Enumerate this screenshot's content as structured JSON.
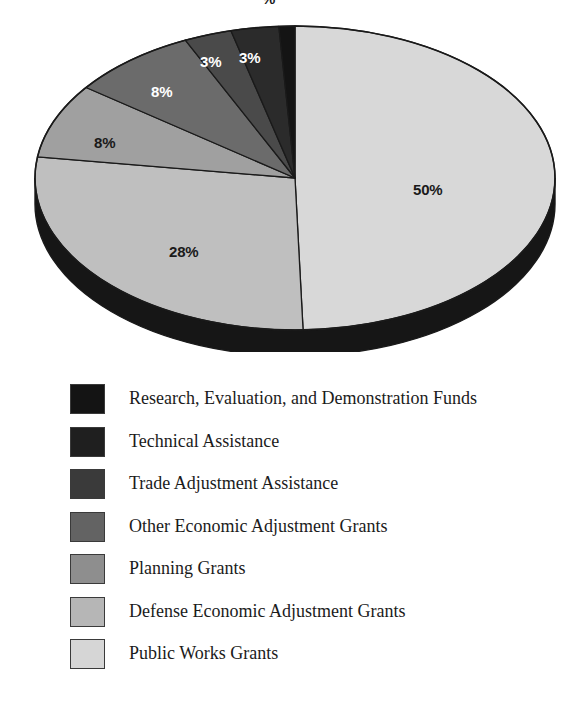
{
  "chart_data": {
    "type": "pie",
    "title": "",
    "subtitle": "",
    "xlabel": "",
    "ylabel": "",
    "legend_position": "below",
    "grid": false,
    "units": "percent",
    "value_suffix": "%",
    "three_d": true,
    "categories": [
      "Public Works Grants",
      "Defense Economic Adjustment Grants",
      "Planning Grants",
      "Other Economic Adjustment Grants",
      "Trade Adjustment Assistance",
      "Technical Assistance",
      "Research, Evaluation, and Demonstration Funds"
    ],
    "values": [
      50,
      28,
      8,
      8,
      3,
      3,
      1
    ],
    "slices": [
      {
        "label": "Public Works Grants",
        "value": 50,
        "display": "50%",
        "color": "#d8d8d8",
        "label_color": "#1a1a1a"
      },
      {
        "label": "Defense Economic Adjustment Grants",
        "value": 28,
        "display": "28%",
        "color": "#bfbfbf",
        "label_color": "#1a1a1a"
      },
      {
        "label": "Planning Grants",
        "value": 8,
        "display": "8%",
        "color": "#a0a0a0",
        "label_color": "#1a1a1a"
      },
      {
        "label": "Other Economic Adjustment Grants",
        "value": 8,
        "display": "8%",
        "color": "#6b6b6b",
        "label_color": "#ffffff"
      },
      {
        "label": "Trade Adjustment Assistance",
        "value": 3,
        "display": "3%",
        "color": "#4a4a4a",
        "label_color": "#ffffff"
      },
      {
        "label": "Technical Assistance",
        "value": 3,
        "display": "3%",
        "color": "#2b2b2b",
        "label_color": "#ffffff"
      },
      {
        "label": "Research, Evaluation, and Demonstration Funds",
        "value": 1,
        "display": "%",
        "color": "#141414",
        "label_color": "#1a1a1a"
      }
    ],
    "data_labels": [
      {
        "name": "slice-label-50",
        "text": "50%",
        "x": 413,
        "y": 182,
        "tone": "dark"
      },
      {
        "name": "slice-label-28",
        "text": "28%",
        "x": 169,
        "y": 244,
        "tone": "dark"
      },
      {
        "name": "slice-label-8a",
        "text": "8%",
        "x": 94,
        "y": 135,
        "tone": "dark"
      },
      {
        "name": "slice-label-8b",
        "text": "8%",
        "x": 151,
        "y": 84,
        "tone": "light"
      },
      {
        "name": "slice-label-3a",
        "text": "3%",
        "x": 200,
        "y": 54,
        "tone": "light"
      },
      {
        "name": "slice-label-3b",
        "text": "3%",
        "x": 239,
        "y": 50,
        "tone": "light"
      },
      {
        "name": "slice-label-1-clipped",
        "text": "%",
        "x": 262,
        "y": -8,
        "tone": "dark"
      }
    ]
  },
  "legend": {
    "items": [
      {
        "label": "Research, Evaluation, and Demonstration Funds",
        "color": "#141414"
      },
      {
        "label": "Technical Assistance",
        "color": "#1f1f1f"
      },
      {
        "label": "Trade Adjustment Assistance",
        "color": "#3a3a3a"
      },
      {
        "label": "Other Economic Adjustment Grants",
        "color": "#636363"
      },
      {
        "label": "Planning Grants",
        "color": "#8e8e8e"
      },
      {
        "label": "Defense Economic Adjustment Grants",
        "color": "#b6b6b6"
      },
      {
        "label": "Public Works Grants",
        "color": "#d6d6d6"
      }
    ]
  },
  "colors": {
    "background": "#ffffff",
    "outline": "#1a1a1a",
    "pie_depth": "#161616",
    "text": "#1b1b1b"
  }
}
